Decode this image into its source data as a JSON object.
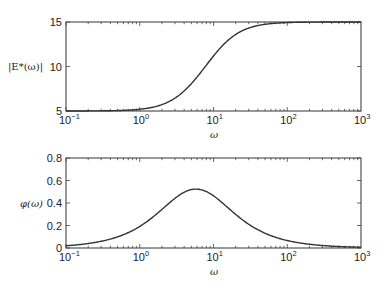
{
  "chart_data": [
    {
      "type": "line",
      "title": "",
      "xlabel": "ω",
      "ylabel": "|E*(ω)|",
      "xscale": "log",
      "xlim": [
        0.1,
        1000
      ],
      "ylim": [
        5,
        15
      ],
      "xticks": [
        0.1,
        1,
        10,
        100,
        1000
      ],
      "xtick_labels": [
        {
          "base": "10",
          "exp": "−1"
        },
        {
          "base": "10",
          "exp": "0"
        },
        {
          "base": "10",
          "exp": "1"
        },
        {
          "base": "10",
          "exp": "2"
        },
        {
          "base": "10",
          "exp": "3"
        }
      ],
      "yticks": [
        5,
        10,
        15
      ],
      "ytick_labels": [
        "5",
        "10",
        "15"
      ],
      "grid": false,
      "legend": null,
      "series": [
        {
          "name": "|E*(ω)|",
          "x": [
            0.1,
            0.3,
            1,
            2,
            3,
            5,
            7,
            10,
            20,
            30,
            50,
            100,
            300,
            1000
          ],
          "values": [
            5.0,
            5.01,
            5.12,
            5.5,
            6.1,
            7.6,
            9.1,
            11.2,
            13.8,
            14.5,
            14.8,
            14.95,
            15.0,
            15.0
          ]
        }
      ]
    },
    {
      "type": "line",
      "title": "",
      "xlabel": "ω",
      "ylabel": "φ(ω)",
      "xscale": "log",
      "xlim": [
        0.1,
        1000
      ],
      "ylim": [
        0,
        0.8
      ],
      "xticks": [
        0.1,
        1,
        10,
        100,
        1000
      ],
      "xtick_labels": [
        {
          "base": "10",
          "exp": "−1"
        },
        {
          "base": "10",
          "exp": "0"
        },
        {
          "base": "10",
          "exp": "1"
        },
        {
          "base": "10",
          "exp": "2"
        },
        {
          "base": "10",
          "exp": "3"
        }
      ],
      "yticks": [
        0,
        0.2,
        0.4,
        0.6,
        0.8
      ],
      "ytick_labels": [
        "0",
        "0.2",
        "0.4",
        "0.6",
        "0.8"
      ],
      "grid": false,
      "legend": null,
      "series": [
        {
          "name": "φ(ω)",
          "x": [
            0.1,
            0.3,
            1,
            2,
            3,
            5,
            5.77,
            7,
            10,
            20,
            30,
            50,
            100,
            300,
            1000
          ],
          "values": [
            0.02,
            0.06,
            0.19,
            0.34,
            0.43,
            0.52,
            0.52,
            0.51,
            0.46,
            0.3,
            0.21,
            0.13,
            0.07,
            0.02,
            0.01
          ]
        }
      ]
    }
  ],
  "model": {
    "E0": 5,
    "Einf": 15,
    "tau": 0.1
  },
  "labels": {
    "top_ylabel": "|E*(ω)|",
    "top_xlabel": "ω",
    "bottom_ylabel": "φ(ω)",
    "bottom_xlabel": "ω"
  }
}
